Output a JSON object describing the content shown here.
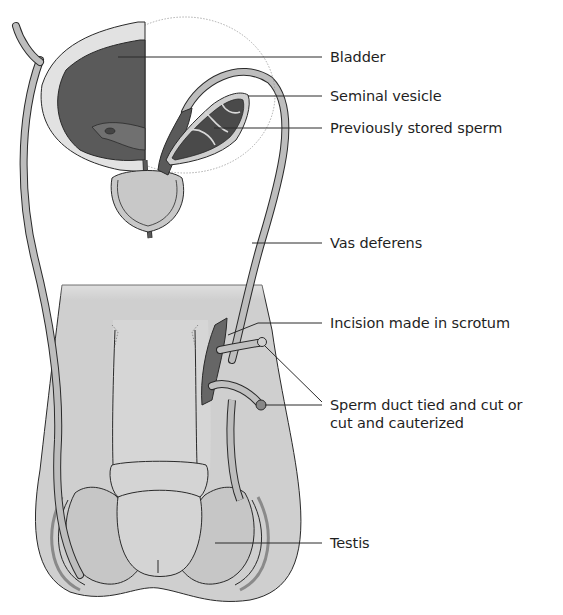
{
  "diagram": {
    "colors": {
      "background": "#ffffff",
      "line": "#2a2a2a",
      "tissue_light": "#d4d4d4",
      "tissue_mid": "#bdbdbd",
      "tissue_dark": "#5e5e5e",
      "duct": "#bfbfbf",
      "label_text": "#1f1f1f"
    },
    "labels": [
      {
        "id": "bladder",
        "text": "Bladder"
      },
      {
        "id": "seminal-vesicle",
        "text": "Seminal vesicle"
      },
      {
        "id": "previously-stored-sperm",
        "text": "Previously stored sperm"
      },
      {
        "id": "vas-deferens",
        "text": "Vas deferens"
      },
      {
        "id": "incision",
        "text": "Incision made in scrotum"
      },
      {
        "id": "sperm-duct",
        "text": "Sperm duct tied and cut or cut and cauterized"
      },
      {
        "id": "testis",
        "text": "Testis"
      }
    ]
  }
}
